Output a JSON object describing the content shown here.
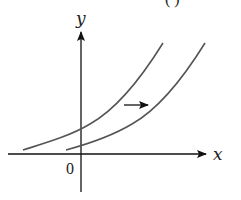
{
  "figure": {
    "partial_caption": "( )",
    "x_axis_label": "x",
    "y_axis_label": "y",
    "origin_label": "0",
    "colors": {
      "axes": "#111111",
      "curves": "#555555",
      "background": "#ffffff"
    },
    "curves": [
      {
        "name": "original-curve",
        "description": "exponential-like curve, left"
      },
      {
        "name": "shifted-curve",
        "description": "same curve translated right"
      }
    ],
    "annotation": {
      "type": "arrow",
      "direction": "right",
      "meaning": "horizontal shift to the right"
    }
  }
}
